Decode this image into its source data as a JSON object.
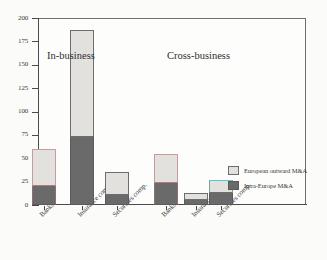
{
  "chart_data": {
    "type": "bar",
    "stacked": true,
    "title": "",
    "xlabel": "",
    "ylabel": "",
    "ylim": [
      0,
      200
    ],
    "yticks": [
      0,
      25,
      50,
      75,
      100,
      125,
      150,
      175,
      200
    ],
    "ytick_labels": [
      "0",
      "25",
      "50",
      "75",
      "100",
      "125",
      "150",
      "175",
      "200"
    ],
    "grid": false,
    "legend_position": "right-inside",
    "groups": [
      {
        "label": "In-business",
        "categories": [
          "Banks",
          "Insurance comp.",
          "Securities comp."
        ]
      },
      {
        "label": "Cross-business",
        "categories": [
          "Banks",
          "Insurance comp.",
          "Securities comp."
        ]
      }
    ],
    "categories": [
      "Banks",
      "Insurance comp.",
      "Securities comp.",
      "Banks",
      "Insurance comp.",
      "Securities comp."
    ],
    "series": [
      {
        "name": "Intra-Europe M&A",
        "color": "#6a6a6a",
        "values": [
          20,
          73,
          11,
          23,
          5,
          13
        ]
      },
      {
        "name": "European outward M&A",
        "color": "#e2e1de",
        "values": [
          40,
          114,
          24,
          32,
          8,
          14
        ]
      }
    ],
    "totals": [
      60,
      187,
      35,
      55,
      13,
      27
    ],
    "bars": [
      {
        "group": "In-business",
        "category": "Banks",
        "intra": 20,
        "outward": 40,
        "total": 60,
        "edge": "pink"
      },
      {
        "group": "In-business",
        "category": "Insurance comp.",
        "intra": 73,
        "outward": 114,
        "total": 187,
        "edge": "none"
      },
      {
        "group": "In-business",
        "category": "Securities comp.",
        "intra": 11,
        "outward": 24,
        "total": 35,
        "edge": "none"
      },
      {
        "group": "Cross-business",
        "category": "Banks",
        "intra": 23,
        "outward": 32,
        "total": 55,
        "edge": "pink"
      },
      {
        "group": "Cross-business",
        "category": "Insurance comp.",
        "intra": 5,
        "outward": 8,
        "total": 13,
        "edge": "none"
      },
      {
        "group": "Cross-business",
        "category": "Securities comp.",
        "intra": 13,
        "outward": 14,
        "total": 27,
        "edge": "cyan"
      }
    ]
  },
  "legend": {
    "items": [
      {
        "label": "European outward M&A",
        "swatch": "light"
      },
      {
        "label": "Intra-Europe M&A",
        "swatch": "dark"
      }
    ]
  }
}
